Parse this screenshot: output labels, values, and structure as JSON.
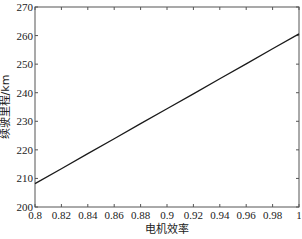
{
  "chart_data": {
    "type": "line",
    "title": "",
    "xlabel": "电机效率",
    "ylabel": "续驶里程/km",
    "xlim": [
      0.8,
      1.0
    ],
    "ylim": [
      200,
      270
    ],
    "xticks": [
      0.8,
      0.82,
      0.84,
      0.86,
      0.88,
      0.9,
      0.92,
      0.94,
      0.96,
      0.98,
      1
    ],
    "xtick_labels": [
      "0.8",
      "0.82",
      "0.84",
      "0.86",
      "0.88",
      "0.9",
      "0.92",
      "0.94",
      "0.96",
      "0.98",
      "1"
    ],
    "yticks": [
      200,
      210,
      220,
      230,
      240,
      250,
      260,
      270
    ],
    "ytick_labels": [
      "200",
      "210",
      "220",
      "230",
      "240",
      "250",
      "260",
      "270"
    ],
    "grid": false,
    "legend": null,
    "series": [
      {
        "name": "续驶里程",
        "color": "#1a1a1a",
        "x": [
          0.8,
          0.82,
          0.84,
          0.86,
          0.88,
          0.9,
          0.92,
          0.94,
          0.96,
          0.98,
          1.0
        ],
        "y": [
          208.2,
          213.4,
          218.7,
          223.9,
          229.2,
          234.4,
          239.6,
          244.9,
          250.1,
          255.4,
          260.6
        ]
      }
    ]
  }
}
